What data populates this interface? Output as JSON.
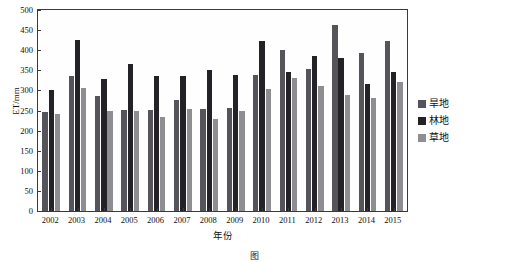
{
  "chart_data": {
    "type": "bar",
    "title": "",
    "xlabel": "年份",
    "ylabel": "ET/mm",
    "ylim": [
      0,
      500
    ],
    "ytick_step": 50,
    "yticks": [
      0,
      50,
      100,
      150,
      200,
      250,
      300,
      350,
      400,
      450,
      500
    ],
    "grid": false,
    "legend_position": "right",
    "categories": [
      "2002",
      "2003",
      "2004",
      "2005",
      "2006",
      "2007",
      "2008",
      "2009",
      "2010",
      "2011",
      "2012",
      "2013",
      "2014",
      "2015"
    ],
    "series": [
      {
        "name": "旱地",
        "color": "#54545a",
        "values": [
          247,
          337,
          285,
          252,
          252,
          277,
          253,
          257,
          338,
          400,
          353,
          462,
          393,
          422
        ]
      },
      {
        "name": "林地",
        "color": "#232327",
        "values": [
          301,
          425,
          328,
          365,
          336,
          336,
          352,
          338,
          422,
          346,
          386,
          380,
          315,
          346
        ]
      },
      {
        "name": "草地",
        "color": "#8e8e92",
        "values": [
          241,
          306,
          248,
          250,
          234,
          253,
          228,
          250,
          303,
          332,
          312,
          288,
          280,
          322
        ]
      }
    ]
  },
  "axis": {
    "y_title": "ET/mm",
    "x_title": "年份"
  },
  "legend": {
    "items": [
      {
        "label": "旱地",
        "color": "#54545a"
      },
      {
        "label": "林地",
        "color": "#232327"
      },
      {
        "label": "草地",
        "color": "#8e8e92"
      }
    ]
  },
  "caption": {
    "text": "图"
  }
}
